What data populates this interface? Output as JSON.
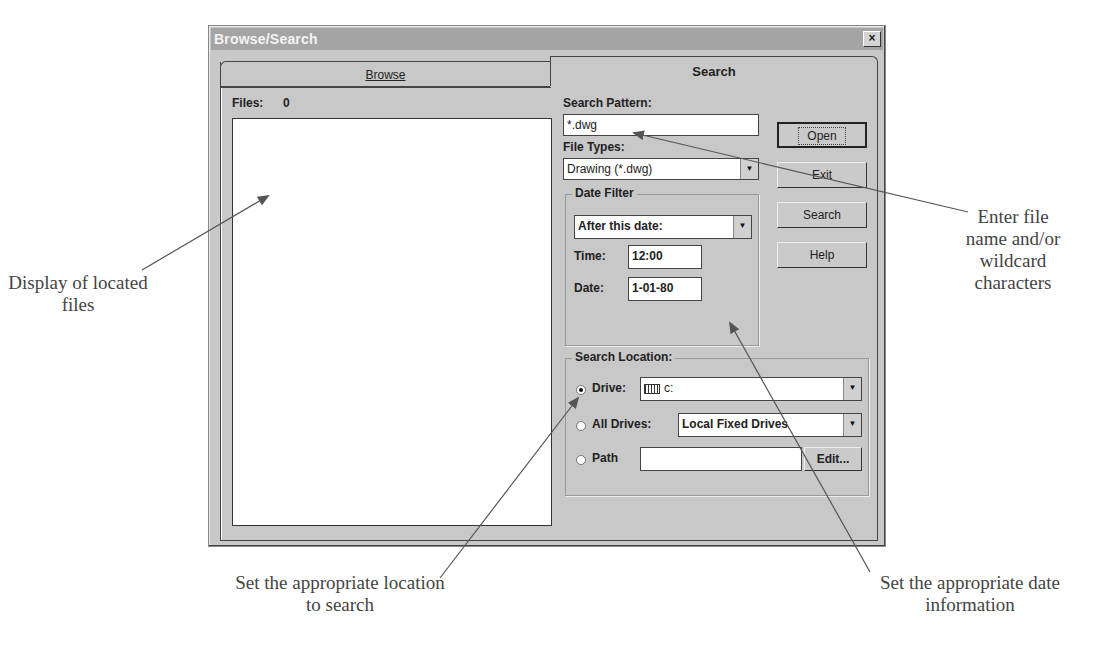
{
  "page": {
    "caption_top": "were created."
  },
  "dialog": {
    "title": "Browse/Search",
    "close_label": "×",
    "tabs": [
      {
        "label": "Browse",
        "active": false
      },
      {
        "label": "Search",
        "active": true
      }
    ],
    "files_label": "Files:",
    "files_count": "0",
    "search_pattern": {
      "label": "Search Pattern:",
      "value": "*.dwg"
    },
    "file_types": {
      "label": "File Types:",
      "value": "Drawing (*.dwg)"
    },
    "buttons": {
      "open": "Open",
      "exit": "Exit",
      "search": "Search",
      "help": "Help"
    },
    "date_filter": {
      "title": "Date Filter",
      "mode": "After this date:",
      "time_label": "Time:",
      "time_value": "12:00",
      "date_label": "Date:",
      "date_value": "1-01-80"
    },
    "search_location": {
      "title": "Search Location:",
      "drive_label": "Drive:",
      "drive_value": "c:",
      "drive_selected": true,
      "all_drives_label": "All Drives:",
      "all_drives_value": "Local Fixed Drives",
      "path_label": "Path",
      "path_value": "",
      "edit_label": "Edit..."
    }
  },
  "callouts": {
    "display_files": "Display of located files",
    "enter_filename": "Enter file name and/or wildcard characters",
    "set_location": "Set the appropriate location to search",
    "set_date": "Set the appropriate date information"
  },
  "colors": {
    "dialog_face": "#c8c8c8",
    "titlebar": "#a4a4a4",
    "arrow": "#555555"
  }
}
